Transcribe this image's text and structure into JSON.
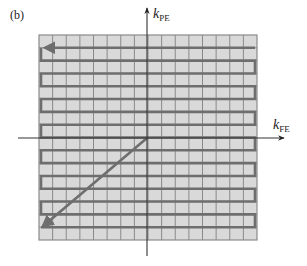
{
  "figure": {
    "panel_label": "(b)",
    "y_axis": {
      "symbol": "k",
      "subscript": "PE"
    },
    "x_axis": {
      "symbol": "k",
      "subscript": "FE"
    },
    "grid": {
      "columns": 16,
      "rows": 16,
      "fill_color": "#d9d9d9",
      "line_color": "#8a8a8a"
    },
    "trajectory": {
      "description": "Center-out diagonal to bottom-left corner, then boustrophedon (snake) raster of rows upward, ending with leftward arrow on top row",
      "color": "#6e6e6e"
    },
    "axes_color": "#333333"
  }
}
